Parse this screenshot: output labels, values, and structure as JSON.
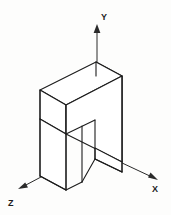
{
  "figure": {
    "background_color": "#fdfdfc",
    "line_color": "#1c1c1c",
    "face_color": "#ffffff"
  },
  "axes": {
    "y": {
      "label": "Y",
      "icon": "arrow-up-icon",
      "direction": "up",
      "label_x": 101,
      "label_y": 20
    },
    "x": {
      "label": "X",
      "icon": "arrow-down-right-icon",
      "direction": "down-right",
      "label_x": 155,
      "label_y": 190
    },
    "z": {
      "label": "Z",
      "icon": "arrow-down-left-icon",
      "direction": "down-left",
      "label_x": 11,
      "label_y": 205
    }
  },
  "solid": {
    "name": "arch-block",
    "description": "Inverted U shaped rectangular block drawn in isometric projection",
    "faces": [
      {
        "name": "top-face",
        "points": "40,90 96,62 122,76 66,105"
      },
      {
        "name": "front-left-face",
        "points": "40,90 66,105 66,134 40,119"
      },
      {
        "name": "right-side-face",
        "points": "96,62 122,76 122,162 96,148"
      },
      {
        "name": "front-lower-band",
        "points": "66,105 122,76 122,162 66,134"
      },
      {
        "name": "left-leg-front",
        "points": "40,119 66,134 66,190 40,176"
      },
      {
        "name": "right-leg-front",
        "points": "96,148 122,162 122,172 96,159"
      }
    ],
    "edges": [
      {
        "name": "inner-notch-left",
        "points": "66,134 95,120"
      },
      {
        "name": "inner-notch-vertical-left",
        "points": "66,134 66,190"
      },
      {
        "name": "inner-gap-left-edge",
        "points": "82,126 82,182"
      },
      {
        "name": "inner-gap-right-edge",
        "points": "95,120 95,159"
      },
      {
        "name": "leg-bottom-left",
        "points": "40,176 66,190"
      },
      {
        "name": "leg-bottom-inner",
        "points": "82,182 95,159"
      }
    ]
  }
}
